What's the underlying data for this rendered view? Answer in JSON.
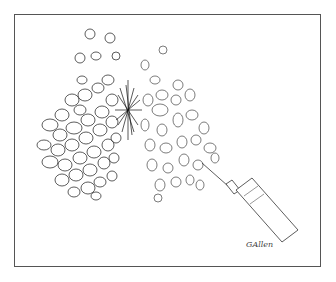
{
  "illustration": {
    "subject": "cell cluster with needle syringe injection",
    "signature": "GAllen",
    "colors": {
      "ink": "#222222",
      "frame": "#555555",
      "background": "#ffffff"
    }
  }
}
